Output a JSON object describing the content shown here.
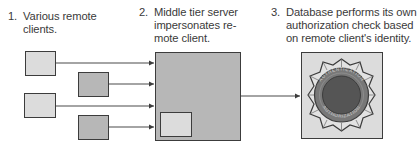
{
  "steps": [
    {
      "number": "1.",
      "text": "Various remote\nclients."
    },
    {
      "number": "2.",
      "text": "Middle tier server\nimpersonates re-\nmote client."
    },
    {
      "number": "3.",
      "text": "Database performs its own\nauthorization check based\non remote client's identity."
    }
  ],
  "seal": {
    "text_left": "AUTHENTICATION",
    "text_right": "AUTHORIZATION"
  },
  "colors": {
    "light_box": "#dcdcdc",
    "medium_box": "#b7b7b7",
    "border": "#3c3c3c",
    "seal_ring": "#707070",
    "seal_center": "#555555"
  }
}
